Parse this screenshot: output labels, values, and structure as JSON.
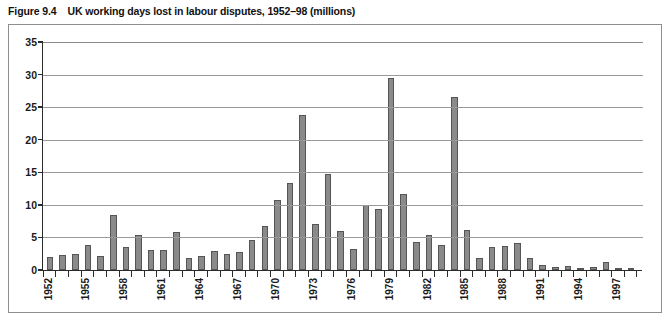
{
  "figure": {
    "label": "Figure 9.4",
    "title": "UK working days lost in labour disputes, 1952–98 (millions)"
  },
  "chart_data": {
    "type": "bar",
    "title": "UK working days lost in labour disputes, 1952–98 (millions)",
    "xlabel": "",
    "ylabel": "",
    "ylim": [
      0,
      35
    ],
    "yticks": [
      0,
      5,
      10,
      15,
      20,
      25,
      30,
      35
    ],
    "grid": true,
    "legend": "none",
    "bar_color": "#8a8a8a",
    "bar_edge_color": "#555555",
    "categories": [
      "1952",
      "1953",
      "1954",
      "1955",
      "1956",
      "1957",
      "1958",
      "1959",
      "1960",
      "1961",
      "1962",
      "1963",
      "1964",
      "1965",
      "1966",
      "1967",
      "1968",
      "1969",
      "1970",
      "1971",
      "1972",
      "1973",
      "1974",
      "1975",
      "1976",
      "1977",
      "1978",
      "1979",
      "1980",
      "1981",
      "1982",
      "1983",
      "1984",
      "1985",
      "1986",
      "1987",
      "1988",
      "1989",
      "1990",
      "1991",
      "1992",
      "1993",
      "1994",
      "1995",
      "1996",
      "1997",
      "1998"
    ],
    "values": [
      2.0,
      2.3,
      2.5,
      3.8,
      2.2,
      8.5,
      3.5,
      5.3,
      3.1,
      3.0,
      5.8,
      1.8,
      2.2,
      2.9,
      2.4,
      2.7,
      4.6,
      6.7,
      10.8,
      13.3,
      23.8,
      7.0,
      14.7,
      6.0,
      3.3,
      10.0,
      9.3,
      29.5,
      11.6,
      4.3,
      5.3,
      3.8,
      26.6,
      6.1,
      1.9,
      3.5,
      3.7,
      4.1,
      1.9,
      0.8,
      0.5,
      0.6,
      0.3,
      0.4,
      1.3,
      0.3,
      0.3
    ],
    "xtick_labels_shown": [
      "1952",
      "1955",
      "1958",
      "1961",
      "1964",
      "1967",
      "1970",
      "1973",
      "1976",
      "1979",
      "1982",
      "1985",
      "1988",
      "1991",
      "1994",
      "1997"
    ],
    "x_tick_label_orientation": "vertical"
  }
}
